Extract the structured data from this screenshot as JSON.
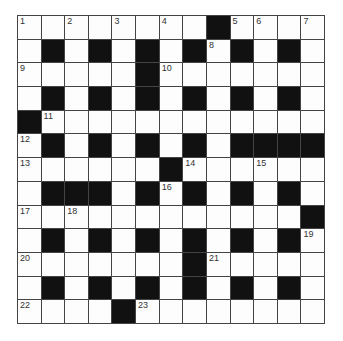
{
  "puzzle": {
    "rows": 13,
    "cols": 13,
    "colors": {
      "block": "#111111",
      "cell": "#fdfdfd",
      "grid_line": "#444444",
      "number_text": "#333333"
    },
    "grid": [
      "........#....",
      ".#.#.#.#.#.#.",
      ".....#.......",
      ".#.#.#.#.#.#.",
      "#............",
      ".#.#.#.#.####",
      "......#......",
      ".###.#.#.#.#.",
      "............#",
      ".#.#.#.#.#.#.",
      ".......#.....",
      ".#.#.#.#.#.#.",
      "....#........"
    ],
    "numbers": [
      {
        "n": "1",
        "r": 0,
        "c": 0
      },
      {
        "n": "2",
        "r": 0,
        "c": 2
      },
      {
        "n": "3",
        "r": 0,
        "c": 4
      },
      {
        "n": "4",
        "r": 0,
        "c": 6
      },
      {
        "n": "5",
        "r": 0,
        "c": 9
      },
      {
        "n": "6",
        "r": 0,
        "c": 10
      },
      {
        "n": "7",
        "r": 0,
        "c": 12
      },
      {
        "n": "8",
        "r": 1,
        "c": 8
      },
      {
        "n": "9",
        "r": 2,
        "c": 0
      },
      {
        "n": "10",
        "r": 2,
        "c": 6
      },
      {
        "n": "11",
        "r": 4,
        "c": 1
      },
      {
        "n": "12",
        "r": 5,
        "c": 0
      },
      {
        "n": "13",
        "r": 6,
        "c": 0
      },
      {
        "n": "14",
        "r": 6,
        "c": 7
      },
      {
        "n": "15",
        "r": 6,
        "c": 10
      },
      {
        "n": "16",
        "r": 7,
        "c": 6
      },
      {
        "n": "17",
        "r": 8,
        "c": 0
      },
      {
        "n": "18",
        "r": 8,
        "c": 2
      },
      {
        "n": "19",
        "r": 9,
        "c": 12
      },
      {
        "n": "20",
        "r": 10,
        "c": 0
      },
      {
        "n": "21",
        "r": 10,
        "c": 8
      },
      {
        "n": "22",
        "r": 12,
        "c": 0
      },
      {
        "n": "23",
        "r": 12,
        "c": 5
      }
    ]
  }
}
